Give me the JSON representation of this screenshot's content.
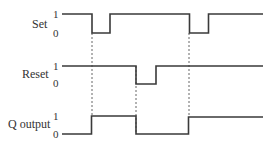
{
  "diagram": {
    "type": "timing-diagram",
    "signals": [
      {
        "name": "Set",
        "level_high_label": "1",
        "level_low_label": "0",
        "waveform": [
          {
            "from": 0,
            "to": 1,
            "level": 1
          },
          {
            "from": 1,
            "to": 1.6,
            "level": 0
          },
          {
            "from": 1.6,
            "to": 4.2,
            "level": 1
          },
          {
            "from": 4.2,
            "to": 4.8,
            "level": 0
          },
          {
            "from": 4.8,
            "to": 6.6,
            "level": 1
          }
        ]
      },
      {
        "name": "Reset",
        "level_high_label": "1",
        "level_low_label": "0",
        "waveform": [
          {
            "from": 0,
            "to": 2.4,
            "level": 1
          },
          {
            "from": 2.4,
            "to": 3.1,
            "level": 0
          },
          {
            "from": 3.1,
            "to": 6.6,
            "level": 1
          }
        ]
      },
      {
        "name": "Q output",
        "level_high_label": "1",
        "level_low_label": "0",
        "waveform": [
          {
            "from": 0,
            "to": 1,
            "level": 0
          },
          {
            "from": 1,
            "to": 2.4,
            "level": 1
          },
          {
            "from": 2.4,
            "to": 4.2,
            "level": 0
          },
          {
            "from": 4.2,
            "to": 6.6,
            "level": 1
          }
        ]
      }
    ],
    "dashed_markers": [
      "Set falls → Q goes high",
      "Reset falls → Q goes low",
      "Set falls → Q goes high"
    ]
  },
  "labels": {
    "set": "Set",
    "reset": "Reset",
    "q": "Q output",
    "one": "1",
    "zero": "0"
  }
}
